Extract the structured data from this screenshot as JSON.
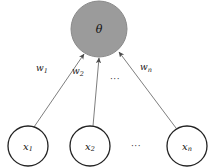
{
  "diagram": {
    "type": "neuron-model",
    "background_color": "#ffffff",
    "output_node": {
      "label": "θ",
      "label_name": "theta",
      "fill_color": "#9b9b9b",
      "stroke_color": "#8a8a8a",
      "cx": 99,
      "cy": 29,
      "r": 28
    },
    "input_nodes": [
      {
        "label": "x",
        "subscript": "1",
        "fill_color": "#ffffff",
        "stroke_color": "#222222",
        "cx": 28,
        "cy": 146,
        "r": 20
      },
      {
        "label": "x",
        "subscript": "2",
        "fill_color": "#ffffff",
        "stroke_color": "#222222",
        "cx": 90,
        "cy": 146,
        "r": 20
      },
      {
        "label": "x",
        "subscript": "n",
        "fill_color": "#ffffff",
        "stroke_color": "#222222",
        "cx": 187,
        "cy": 146,
        "r": 20
      }
    ],
    "edges": [
      {
        "weight_label": "w",
        "weight_subscript": "1",
        "from": "x1",
        "to": "theta",
        "x1": 34,
        "y1": 127,
        "x2": 84,
        "y2": 54,
        "label_x": 36,
        "label_y": 71,
        "stroke_color": "#6f6f6f"
      },
      {
        "weight_label": "w",
        "weight_subscript": "2",
        "from": "x2",
        "to": "theta",
        "x1": 93,
        "y1": 126,
        "x2": 99,
        "y2": 58,
        "label_x": 72,
        "label_y": 74,
        "stroke_color": "#6f6f6f"
      },
      {
        "weight_label": "w",
        "weight_subscript": "n",
        "from": "xn",
        "to": "theta",
        "x1": 176,
        "y1": 128,
        "x2": 119,
        "y2": 52,
        "label_x": 140,
        "label_y": 70,
        "stroke_color": "#6f6f6f"
      }
    ],
    "ellipses": [
      {
        "text": "···",
        "name": "weights-ellipsis",
        "x": 115,
        "y": 82
      },
      {
        "text": "···",
        "name": "inputs-ellipsis",
        "x": 136,
        "y": 149
      }
    ]
  }
}
